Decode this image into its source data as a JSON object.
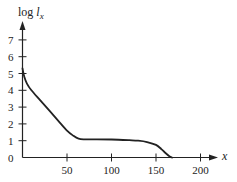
{
  "chart_data": {
    "type": "line",
    "title": "",
    "xlabel": "x",
    "ylabel": "log l_x",
    "ylabel_parts": {
      "main": "log ",
      "var": "l",
      "sub": "x"
    },
    "xlim": [
      0,
      215
    ],
    "ylim": [
      0,
      7.8
    ],
    "x_ticks": [
      50,
      100,
      150,
      200
    ],
    "x_tick_labels": [
      "50",
      "100",
      "150",
      "200"
    ],
    "y_ticks": [
      0,
      1,
      2,
      3,
      4,
      5,
      6,
      7
    ],
    "y_tick_labels": [
      "0",
      "1",
      "2",
      "3",
      "4",
      "5",
      "6",
      "7"
    ],
    "grid": false,
    "legend": null,
    "series": [
      {
        "name": "survivorship curve",
        "x": [
          0,
          2,
          5,
          10,
          20,
          30,
          40,
          50,
          57,
          63,
          70,
          80,
          100,
          120,
          130,
          140,
          150,
          156,
          160,
          165,
          168
        ],
        "y": [
          5.3,
          4.8,
          4.4,
          4.0,
          3.4,
          2.8,
          2.2,
          1.6,
          1.3,
          1.12,
          1.08,
          1.08,
          1.07,
          1.03,
          1.0,
          0.92,
          0.75,
          0.5,
          0.3,
          0.08,
          0.0
        ]
      }
    ],
    "color": "#222222"
  }
}
